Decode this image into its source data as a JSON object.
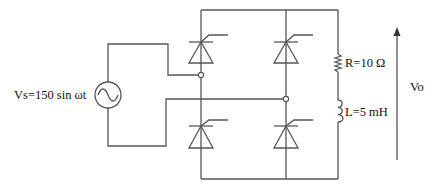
{
  "diagram": {
    "type": "single-phase full-controlled thyristor bridge rectifier",
    "source": {
      "label": "Vs=150 sin ωt",
      "icon": "ac-source-icon"
    },
    "load": {
      "resistor": {
        "label": "R=10 Ω"
      },
      "inductor": {
        "label": "L=5 mH"
      }
    },
    "output": {
      "label": "Vo"
    },
    "thyristors": [
      {
        "id": "T1",
        "position": "top-left"
      },
      {
        "id": "T2",
        "position": "top-right"
      },
      {
        "id": "T3",
        "position": "bottom-left"
      },
      {
        "id": "T4",
        "position": "bottom-right"
      }
    ],
    "colors": {
      "wire": "#555555",
      "text": "#111111",
      "background": "#ffffff"
    }
  }
}
